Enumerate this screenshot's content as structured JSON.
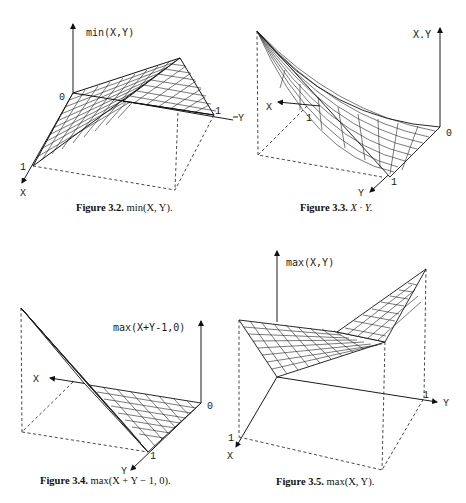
{
  "figures": [
    {
      "id": "fig-3-2",
      "caption_label": "Figure 3.2.",
      "caption_expr": "min(X, Y).",
      "z_label": "min(X,Y)",
      "ticks": {
        "origin": "0",
        "x_one": "1",
        "y_one": "1"
      },
      "axes": {
        "x": "X",
        "y": "Y"
      }
    },
    {
      "id": "fig-3-3",
      "caption_label": "Figure 3.3.",
      "caption_expr": "X · Y.",
      "z_label": "X.Y",
      "ticks": {
        "origin": "0",
        "x_one": "1",
        "y_one": "1"
      },
      "axes": {
        "x": "X",
        "y": "Y",
        "y_left": "Y"
      }
    },
    {
      "id": "fig-3-4",
      "caption_label": "Figure 3.4.",
      "caption_expr": "max(X + Y − 1, 0).",
      "z_label": "max(X+Y-1,0)",
      "ticks": {
        "origin": "0",
        "y_one": "1"
      },
      "axes": {
        "x": "X",
        "y": "Y"
      }
    },
    {
      "id": "fig-3-5",
      "caption_label": "Figure 3.5.",
      "caption_expr": "max(X, Y).",
      "z_label": "max(X,Y)",
      "ticks": {
        "x_one": "1",
        "y_one": "1"
      },
      "axes": {
        "x": "X",
        "y": "Y"
      }
    }
  ]
}
